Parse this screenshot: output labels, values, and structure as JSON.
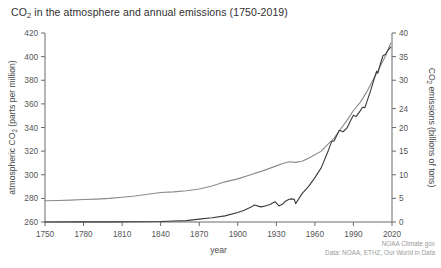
{
  "figure": {
    "title_prefix": "CO",
    "title_sub": "2",
    "title_rest": " in the atmosphere and annual emissions (1750-2019)",
    "title_full": "CO2 in the atmosphere and annual emissions (1750-2019)",
    "background_color": "#ffffff",
    "credit_line1": "NOAA Climate.gov",
    "credit_line2": "Data: NOAA, ETHZ, Our World in Data"
  },
  "chart_data": {
    "type": "line",
    "title": "CO2 in the atmosphere and annual emissions (1750-2019)",
    "xlabel": "year",
    "xlim": [
      1750,
      2020
    ],
    "xticks": [
      1750,
      1780,
      1810,
      1840,
      1870,
      1900,
      1930,
      1960,
      1990,
      2020
    ],
    "xtick_labels": [
      "1750",
      "1780",
      "1810",
      "1840",
      "1870",
      "1900",
      "1930",
      "1960",
      "1990",
      "2020"
    ],
    "grid": false,
    "legend": "none",
    "axes": [
      {
        "id": "left",
        "label_prefix": "atmospheric CO",
        "label_sub": "2",
        "label_rest": " (parts per million)",
        "label": "atmospheric CO2 (parts per million)",
        "ylim": [
          260,
          420
        ],
        "yticks": [
          260,
          280,
          300,
          320,
          340,
          360,
          380,
          400,
          420
        ],
        "ytick_labels": [
          "260",
          "280",
          "300",
          "320",
          "340",
          "360",
          "380",
          "400",
          "420"
        ]
      },
      {
        "id": "right",
        "label_prefix": "CO",
        "label_sub": "2",
        "label_rest": " emissions (billions of tons)",
        "label": "CO2 emissions (billions of tons)",
        "ylim": [
          0,
          40
        ],
        "yticks": [
          0,
          5,
          10,
          15,
          20,
          24,
          30,
          35,
          40
        ],
        "ytick_labels": [
          "0",
          "5",
          "10",
          "15",
          "20",
          "24",
          "30",
          "35",
          "40"
        ]
      }
    ],
    "series": [
      {
        "name": "atmospheric CO2",
        "axis": "left",
        "units": "parts per million",
        "color": "#8a8a8a",
        "x": [
          1750,
          1760,
          1770,
          1780,
          1790,
          1800,
          1810,
          1820,
          1830,
          1840,
          1850,
          1860,
          1870,
          1880,
          1890,
          1900,
          1910,
          1920,
          1930,
          1935,
          1940,
          1945,
          1950,
          1955,
          1960,
          1965,
          1970,
          1975,
          1980,
          1985,
          1990,
          1995,
          2000,
          2005,
          2010,
          2015,
          2019
        ],
        "values": [
          278,
          278.2,
          278.5,
          279,
          279.4,
          280,
          281,
          282,
          283.5,
          285,
          285.5,
          286.5,
          288,
          290.5,
          294,
          296.5,
          300,
          303.5,
          307.5,
          309.5,
          311,
          310.5,
          311.5,
          314,
          316.9,
          320,
          325.7,
          331,
          338.7,
          346,
          354.4,
          360.8,
          369.5,
          379.8,
          389.9,
          400.8,
          411.5
        ]
      },
      {
        "name": "CO2 emissions",
        "axis": "right",
        "units": "billions of tons",
        "color": "#3a3a3a",
        "x": [
          1750,
          1780,
          1800,
          1820,
          1840,
          1850,
          1860,
          1870,
          1880,
          1890,
          1900,
          1905,
          1910,
          1913,
          1918,
          1920,
          1925,
          1929,
          1932,
          1935,
          1937,
          1940,
          1942,
          1944,
          1945,
          1946,
          1950,
          1955,
          1960,
          1965,
          1970,
          1973,
          1975,
          1979,
          1982,
          1985,
          1988,
          1990,
          1992,
          1995,
          1997,
          1999,
          2000,
          2003,
          2005,
          2008,
          2009,
          2011,
          2013,
          2015,
          2017,
          2019
        ],
        "values": [
          0.01,
          0.02,
          0.03,
          0.05,
          0.1,
          0.2,
          0.3,
          0.6,
          0.9,
          1.3,
          2.0,
          2.5,
          3.1,
          3.6,
          3.2,
          3.3,
          3.7,
          4.3,
          3.4,
          3.8,
          4.4,
          4.8,
          4.9,
          4.8,
          3.9,
          4.3,
          6.0,
          7.5,
          9.4,
          11.5,
          14.8,
          17.0,
          17.2,
          19.4,
          19.1,
          19.9,
          21.6,
          22.6,
          22.3,
          23.4,
          24.3,
          24.2,
          25.1,
          27.5,
          29.3,
          31.9,
          31.5,
          33.5,
          35.2,
          35.5,
          36.4,
          37.0
        ]
      }
    ]
  }
}
